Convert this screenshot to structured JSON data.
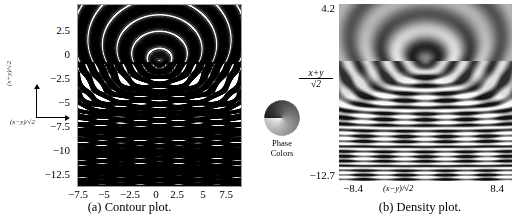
{
  "figure": {
    "kind": "two-panel scientific figure"
  },
  "panel_a": {
    "caption": "(a) Contour plot.",
    "x_axis_label": "(x−y)/√2",
    "y_axis_label": "(x+y)/√2",
    "x_ticks": [
      "−7.5",
      "−5",
      "−2.5",
      "0",
      "2.5",
      "5",
      "7.5"
    ],
    "y_ticks": [
      "2.5",
      "0",
      "−2.5",
      "−5",
      "−7.5",
      "−10",
      "−12.5"
    ],
    "inset_axis_x": "(x−y)/√2",
    "inset_axis_y": "(x+y)/√2"
  },
  "panel_b": {
    "caption": "(b) Density plot.",
    "x_axis_label": "(x−y)/√2",
    "y_axis_label_numerator": "x+y",
    "y_axis_label_denominator": "2",
    "y_max": "4.2",
    "y_min": "−12.7",
    "x_min": "−8.4",
    "x_max": "8.4"
  },
  "legend": {
    "title_line_1": "Phase",
    "title_line_2": "Colors",
    "type": "phase-color-wheel",
    "colormap": "grayscale-cyclic"
  },
  "colors": {
    "frame": "#9a9a9a",
    "contour_line": "#000000",
    "text": "#000000",
    "background": "#ffffff",
    "density_mid": "#808080",
    "density_light": "#f2f2f2",
    "density_dark": "#2b2b2b"
  },
  "chart_data": {
    "type": "line",
    "title": "",
    "panels": [
      {
        "id": "a",
        "type": "contour",
        "title": "(a) Contour plot.",
        "xlabel": "(x−y)/√2",
        "ylabel": "(x+y)/√2",
        "xlim": [
          -8.4,
          8.4
        ],
        "ylim": [
          -12.7,
          4.2
        ],
        "xticks": [
          -7.5,
          -5,
          -2.5,
          0,
          2.5,
          5,
          7.5
        ],
        "yticks": [
          2.5,
          0,
          -2.5,
          -5,
          -7.5,
          -10,
          -12.5
        ],
        "grid": false,
        "legend": "none",
        "contour_levels": 40,
        "features": "cusp caustic at u=0, v≈−1.5; hyperbolic fringes opening upward; dense oscillatory lattice for v < −5"
      },
      {
        "id": "b",
        "type": "heatmap",
        "title": "(b) Density plot.",
        "xlabel": "(x−y)/√2",
        "ylabel": "(x+y)/√2",
        "xlim": [
          -8.4,
          8.4
        ],
        "ylim": [
          -12.7,
          4.2
        ],
        "xticks": [
          -8.4,
          8.4
        ],
        "yticks": [
          -12.7,
          4.2
        ],
        "grid": false,
        "legend": "phase color wheel",
        "colorbar_label": "Phase Colors",
        "cmap": "cyclic-gray"
      }
    ]
  }
}
